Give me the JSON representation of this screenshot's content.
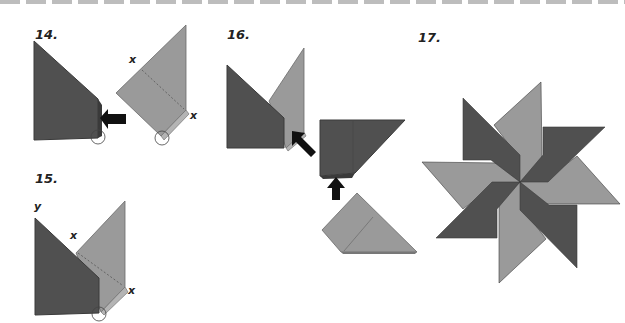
{
  "colors": {
    "dark": "#505050",
    "light": "#9a9a9a",
    "edge": "#3a3a3a",
    "arrow": "#111111",
    "dash": "#bdbdbd"
  },
  "steps": [
    {
      "number": "14.",
      "marks": [
        "x",
        "x"
      ]
    },
    {
      "number": "15.",
      "marks": [
        "y",
        "x",
        "y",
        "x"
      ]
    },
    {
      "number": "16.",
      "marks": []
    },
    {
      "number": "17.",
      "marks": []
    }
  ]
}
